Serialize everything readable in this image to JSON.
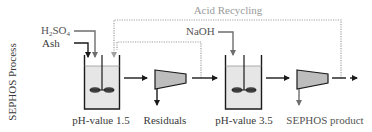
{
  "diagram": {
    "side_label": "SEPHOS Process",
    "inputs": {
      "acid": "H2SO4",
      "acid_base": "H",
      "acid_sub1": "2",
      "acid_mid": "SO",
      "acid_sub2": "4",
      "ash": "Ash",
      "base": "NaOH"
    },
    "recycle_label": "Acid Recycling",
    "stages": [
      {
        "type": "stirred-tank",
        "label": "pH-value 1.5"
      },
      {
        "type": "separator",
        "output_label": "Residuals"
      },
      {
        "type": "stirred-tank",
        "label": "pH-value 3.5"
      },
      {
        "type": "separator",
        "output_label": "SEPHOS product"
      }
    ],
    "colors": {
      "line_dark": "#1a1a1a",
      "line_grey": "#6e6e6e",
      "dotted": "#a0a0a0",
      "liquid": "#e6e6e6",
      "separator_fill": "#bdbdbd"
    }
  }
}
